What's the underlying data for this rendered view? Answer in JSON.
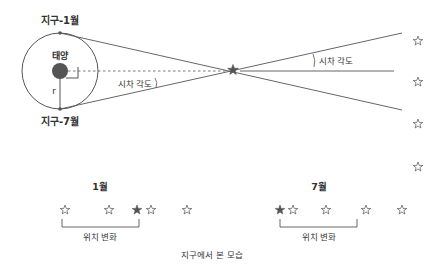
{
  "labels": {
    "earth_jan": "지구-1월",
    "earth_jul": "지구-7월",
    "sun": "태양",
    "radius": "r",
    "parallax_left": "시차 각도",
    "parallax_right": "시차 각도",
    "month_jan": "1월",
    "month_jul": "7월",
    "position_change_jan": "위치 변화",
    "position_change_jul": "위치 변화",
    "caption": "지구에서 본 모습"
  },
  "colors": {
    "line": "#555555",
    "text": "#333333",
    "sun": "#555555",
    "target_star": "#555555"
  }
}
